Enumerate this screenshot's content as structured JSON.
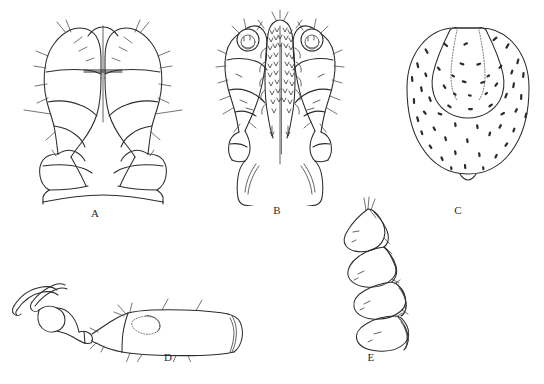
{
  "figure": {
    "kind": "scientific-line-drawing-plate",
    "background_color": "#ffffff",
    "ink_color": "#2b2b2b",
    "width": 544,
    "height": 384,
    "panel_count": 5
  },
  "panels": [
    {
      "id": "A",
      "label": "A",
      "label_x": 95,
      "label_y": 214,
      "subject": "gnathosoma-ventral-view",
      "description": "Paired palpal segments flanking a midline suture, with basal capitulum and subcapitular base"
    },
    {
      "id": "B",
      "label": "B",
      "label_x": 277,
      "label_y": 211,
      "subject": "gnathosoma-dorsal-view",
      "description": "Paired palps bearing terminal sensory organs, central chelicerae with dense setae rows, broad hypostome base"
    },
    {
      "id": "C",
      "label": "C",
      "label_x": 458,
      "label_y": 211,
      "subject": "idiosoma-dorsal-shield",
      "description": "Oval body shield with scattered setae and a dotted anterior subtriangular outline"
    },
    {
      "id": "D",
      "label": "D",
      "label_x": 168,
      "label_y": 358,
      "subject": "leg-tarsus-lateral-view",
      "description": "Elongate tarsal segment bearing setae, with pretarsus, claws and ambulacrum at left"
    },
    {
      "id": "E",
      "label": "E",
      "label_x": 371,
      "label_y": 358,
      "subject": "palp-segments-chain",
      "description": "Chain of four detached palpal articles in series"
    }
  ]
}
